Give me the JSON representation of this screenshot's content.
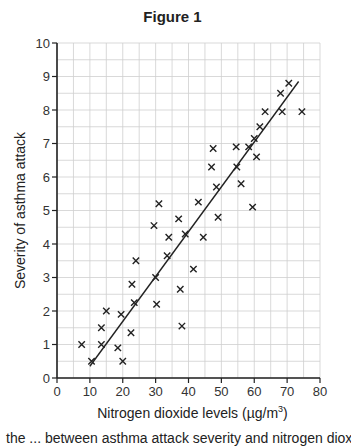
{
  "title": "Figure 1",
  "caption_partial": "the ... between asthma attack severity and nitrogen dioxide levels",
  "chart_data": {
    "type": "scatter",
    "title": "Figure 1",
    "xlabel": "Nitrogen dioxide levels (µg/m³)",
    "xlabel_main": "Nitrogen dioxide levels (µg/m",
    "xlabel_sup": "3",
    "xlabel_end": ")",
    "ylabel": "Severity of asthma attack",
    "xlim": [
      0,
      80
    ],
    "ylim": [
      0,
      10
    ],
    "xticks": [
      0,
      10,
      20,
      30,
      40,
      50,
      60,
      70,
      80
    ],
    "yticks": [
      0,
      1,
      2,
      3,
      4,
      5,
      6,
      7,
      8,
      9,
      10
    ],
    "grid": true,
    "grid_minor_x": 5,
    "grid_minor_y": 0.5,
    "marker": "x",
    "points": [
      [
        7.5,
        1.0
      ],
      [
        10.5,
        0.5
      ],
      [
        13.5,
        1.0
      ],
      [
        13.5,
        1.5
      ],
      [
        15,
        2.0
      ],
      [
        18.5,
        0.9
      ],
      [
        19.5,
        1.9
      ],
      [
        20,
        0.5
      ],
      [
        22.5,
        1.35
      ],
      [
        22.8,
        2.8
      ],
      [
        23.5,
        2.25
      ],
      [
        24,
        3.5
      ],
      [
        29.5,
        4.55
      ],
      [
        30,
        3.0
      ],
      [
        30.3,
        2.2
      ],
      [
        31,
        5.2
      ],
      [
        33.5,
        3.65
      ],
      [
        34,
        4.2
      ],
      [
        37,
        4.75
      ],
      [
        37.5,
        2.65
      ],
      [
        38,
        1.55
      ],
      [
        39,
        4.3
      ],
      [
        41.5,
        3.25
      ],
      [
        43,
        5.25
      ],
      [
        44.5,
        4.2
      ],
      [
        47,
        6.3
      ],
      [
        47.5,
        6.85
      ],
      [
        48.5,
        5.7
      ],
      [
        49,
        4.8
      ],
      [
        54.5,
        6.9
      ],
      [
        54.7,
        6.3
      ],
      [
        56,
        5.8
      ],
      [
        58.3,
        6.9
      ],
      [
        59.5,
        5.1
      ],
      [
        60,
        7.15
      ],
      [
        60.7,
        6.6
      ],
      [
        61.7,
        7.5
      ],
      [
        63.3,
        7.95
      ],
      [
        68,
        8.5
      ],
      [
        68.5,
        7.95
      ],
      [
        70.5,
        8.8
      ],
      [
        74.5,
        7.95
      ]
    ],
    "trend_line": {
      "x0": 10,
      "y0": 0.35,
      "x1": 73.5,
      "y1": 8.85
    }
  }
}
